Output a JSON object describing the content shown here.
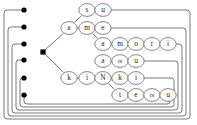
{
  "diagram": {
    "type": "trie-automaton",
    "background_color": "#ffffff",
    "line_color": "#555555",
    "node_stroke_color": "#666666",
    "node_fill_color": "#ffffff",
    "terminal_dot_color": "#000000",
    "hub_color": "#000000",
    "border_color": "#777777"
  },
  "hub": {
    "name": "start-hub",
    "x": 43,
    "y": 52
  },
  "terminal_dots": [
    {
      "label": "",
      "x": 24,
      "y": 10
    },
    {
      "label": "",
      "x": 24,
      "y": 27
    },
    {
      "label": "",
      "x": 24,
      "y": 44
    },
    {
      "label": "",
      "x": 24,
      "y": 60
    },
    {
      "label": "",
      "x": 24,
      "y": 78
    },
    {
      "label": "",
      "x": 24,
      "y": 95
    }
  ],
  "nodes": [
    {
      "id": "n_s",
      "label": "s",
      "x": 87,
      "y": 10
    },
    {
      "id": "n_u1",
      "label": "u",
      "x": 103,
      "y": 10
    },
    {
      "id": "n_a1",
      "label": "a",
      "x": 69,
      "y": 28
    },
    {
      "id": "n_m1",
      "label": "m",
      "x": 87,
      "y": 28
    },
    {
      "id": "n_e1",
      "label": "e",
      "x": 103,
      "y": 28
    },
    {
      "id": "n_a2",
      "label": "a",
      "x": 103,
      "y": 44
    },
    {
      "id": "n_m2",
      "label": "m",
      "x": 120,
      "y": 44
    },
    {
      "id": "n_o",
      "label": "o",
      "x": 136,
      "y": 44
    },
    {
      "id": "n_r",
      "label": "r",
      "x": 152,
      "y": 44
    },
    {
      "id": "n_i1",
      "label": "i",
      "x": 168,
      "y": 44
    },
    {
      "id": "n_a3",
      "label": "a",
      "x": 103,
      "y": 61
    },
    {
      "id": "n_ts1",
      "label": "ts",
      "x": 120,
      "y": 61
    },
    {
      "id": "n_u2",
      "label": "u",
      "x": 136,
      "y": 61
    },
    {
      "id": "n_k1",
      "label": "k",
      "x": 69,
      "y": 78
    },
    {
      "id": "n_i2",
      "label": "i",
      "x": 87,
      "y": 78
    },
    {
      "id": "n_N",
      "label": "N",
      "x": 103,
      "y": 78
    },
    {
      "id": "n_k2",
      "label": "k",
      "x": 120,
      "y": 78
    },
    {
      "id": "n_i3",
      "label": "i",
      "x": 136,
      "y": 78
    },
    {
      "id": "n_t",
      "label": "t",
      "x": 120,
      "y": 95
    },
    {
      "id": "n_e2",
      "label": "e",
      "x": 136,
      "y": 95
    },
    {
      "id": "n_ts2",
      "label": "ts",
      "x": 152,
      "y": 95
    },
    {
      "id": "n_u3",
      "label": "u",
      "x": 168,
      "y": 95
    }
  ],
  "words": [
    {
      "text": "su",
      "nodes": [
        "n_s",
        "n_u1"
      ]
    },
    {
      "text": "ame",
      "nodes": [
        "n_a1",
        "n_m1",
        "n_e1"
      ]
    },
    {
      "text": "amori",
      "nodes": [
        "n_a1",
        "n_m1",
        "n_a2",
        "n_m2",
        "n_o",
        "n_r",
        "n_i1"
      ]
    },
    {
      "text": "atsu",
      "nodes": [
        "n_a3",
        "n_ts1",
        "n_u2"
      ]
    },
    {
      "text": "kiNki",
      "nodes": [
        "n_k1",
        "n_i2",
        "n_N",
        "n_k2",
        "n_i3"
      ]
    },
    {
      "text": "kiNtetsu",
      "nodes": [
        "n_k1",
        "n_i2",
        "n_N",
        "n_t",
        "n_e2",
        "n_ts2",
        "n_u3"
      ]
    }
  ],
  "tree_edges": [
    [
      "hub",
      "n_a1"
    ],
    [
      "hub",
      "n_k1"
    ],
    [
      "n_a1",
      "n_s"
    ],
    [
      "n_s",
      "n_u1"
    ],
    [
      "n_a1",
      "n_m1"
    ],
    [
      "n_m1",
      "n_e1"
    ],
    [
      "n_m1",
      "n_a2"
    ],
    [
      "n_a2",
      "n_m2"
    ],
    [
      "n_m2",
      "n_o"
    ],
    [
      "n_o",
      "n_r"
    ],
    [
      "n_r",
      "n_i1"
    ],
    [
      "n_a3",
      "n_ts1"
    ],
    [
      "n_ts1",
      "n_u2"
    ],
    [
      "n_k1",
      "n_i2"
    ],
    [
      "n_i2",
      "n_N"
    ],
    [
      "n_N",
      "n_k2"
    ],
    [
      "n_k2",
      "n_i3"
    ],
    [
      "n_N",
      "n_t"
    ],
    [
      "n_t",
      "n_e2"
    ],
    [
      "n_e2",
      "n_ts2"
    ],
    [
      "n_ts2",
      "n_u3"
    ]
  ],
  "feedback_loops": [
    {
      "from": "n_u1",
      "to_dot": 0,
      "right_x": 190,
      "bottom_y": 119,
      "left_x": 4
    },
    {
      "from": "n_e1",
      "to_dot": 1,
      "right_x": 186,
      "bottom_y": 116,
      "left_x": 8
    },
    {
      "from": "n_i1",
      "to_dot": 2,
      "right_x": 182,
      "bottom_y": 113,
      "left_x": 12
    },
    {
      "from": "n_u2",
      "to_dot": 3,
      "right_x": 178,
      "bottom_y": 110,
      "left_x": 16
    },
    {
      "from": "n_i3",
      "to_dot": 4,
      "right_x": 174,
      "bottom_y": 107,
      "left_x": 20
    },
    {
      "from": "n_u3",
      "to_dot": 5,
      "right_x": 170,
      "bottom_y": 104,
      "left_x": 24
    }
  ]
}
